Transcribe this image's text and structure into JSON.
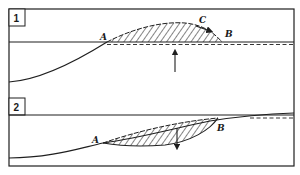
{
  "figure": {
    "colors": {
      "ink": "#1f1f1f",
      "background": "#ffffff"
    },
    "panels": [
      {
        "number": "1",
        "points": {
          "a": "A",
          "b": "B",
          "c": "C"
        },
        "arrow_direction": "up"
      },
      {
        "number": "2",
        "points": {
          "a": "A",
          "b": "B"
        },
        "arrow_direction": "down"
      }
    ]
  }
}
